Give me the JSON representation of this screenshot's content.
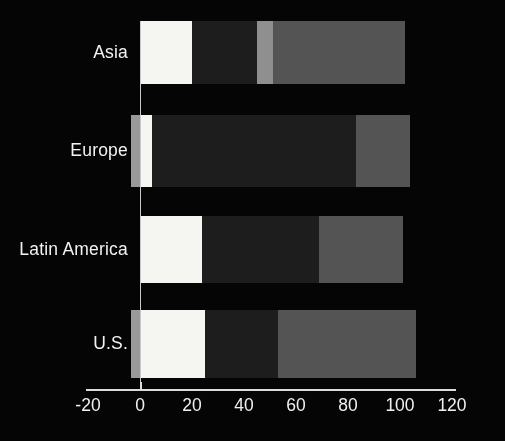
{
  "chart_data": {
    "type": "bar",
    "orientation": "horizontal",
    "stacked": true,
    "title": "",
    "subtitle": "",
    "xlabel": "",
    "ylabel": "",
    "categories": [
      "Asia",
      "Europe",
      "Latin America",
      "U.S."
    ],
    "xlim": [
      -20,
      120
    ],
    "xticks": [
      -20,
      0,
      20,
      40,
      60,
      80,
      100,
      120
    ],
    "xtick_labels": [
      "-20",
      "0",
      "20",
      "40",
      "60",
      "80",
      "100",
      "120"
    ],
    "grid": false,
    "legend": "none",
    "background_color": "#050505",
    "axis_color": "#dcdcdc",
    "series": [
      {
        "name": "segment-1",
        "color": "#f5f5f2",
        "values": [
          20,
          4.5,
          24,
          25
        ]
      },
      {
        "name": "segment-2",
        "color": "#1d1d1d",
        "values": [
          25,
          78.5,
          45,
          28
        ]
      },
      {
        "name": "segment-3",
        "color": "#8f8f8f",
        "values": [
          6,
          0,
          0,
          0
        ]
      },
      {
        "name": "segment-4",
        "color": "#545454",
        "values": [
          51,
          21,
          32,
          53
        ]
      },
      {
        "name": "segment-negative",
        "color": "#9a9a9a",
        "values": [
          0,
          -3.5,
          0,
          -3.5
        ]
      }
    ],
    "bars": [
      {
        "category": "Asia",
        "total": 102,
        "segments": [
          {
            "name": "seg-white",
            "start": 0,
            "end": 20,
            "color": "#f5f5f2"
          },
          {
            "name": "seg-dark",
            "start": 20,
            "end": 45,
            "color": "#1d1d1d"
          },
          {
            "name": "seg-light-gray",
            "start": 45,
            "end": 51,
            "color": "#8f8f8f"
          },
          {
            "name": "seg-mid-gray",
            "start": 51,
            "end": 102,
            "color": "#545454"
          }
        ]
      },
      {
        "category": "Europe",
        "total": 104,
        "segments": [
          {
            "name": "seg-negative-gray",
            "start": -3.5,
            "end": 0,
            "color": "#9a9a9a"
          },
          {
            "name": "seg-white",
            "start": 0,
            "end": 4.5,
            "color": "#f5f5f2"
          },
          {
            "name": "seg-dark",
            "start": 4.5,
            "end": 83,
            "color": "#1d1d1d"
          },
          {
            "name": "seg-mid-gray",
            "start": 83,
            "end": 104,
            "color": "#545454"
          }
        ]
      },
      {
        "category": "Latin America",
        "total": 101,
        "segments": [
          {
            "name": "seg-white",
            "start": 0,
            "end": 24,
            "color": "#f5f5f2"
          },
          {
            "name": "seg-dark",
            "start": 24,
            "end": 69,
            "color": "#1d1d1d"
          },
          {
            "name": "seg-mid-gray",
            "start": 69,
            "end": 101,
            "color": "#545454"
          }
        ]
      },
      {
        "category": "U.S.",
        "total": 106,
        "segments": [
          {
            "name": "seg-negative-gray",
            "start": -3.5,
            "end": 0,
            "color": "#9a9a9a"
          },
          {
            "name": "seg-white",
            "start": 0,
            "end": 25,
            "color": "#f5f5f2"
          },
          {
            "name": "seg-dark",
            "start": 25,
            "end": 53,
            "color": "#1d1d1d"
          },
          {
            "name": "seg-mid-gray",
            "start": 53,
            "end": 106,
            "color": "#545454"
          }
        ]
      }
    ]
  },
  "layout": {
    "x_origin_px": 140,
    "px_per_unit": 2.6,
    "axis_y_px": 389,
    "axis_x_start_px": 86,
    "axis_x_end_px": 456,
    "tick_label_y_px": 397,
    "bar_geometry": [
      {
        "top": 21,
        "height": 63
      },
      {
        "top": 115,
        "height": 72
      },
      {
        "top": 216,
        "height": 67
      },
      {
        "top": 310,
        "height": 68
      }
    ],
    "label_right_px": 128
  }
}
